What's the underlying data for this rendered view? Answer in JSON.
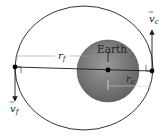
{
  "diagram": {
    "body_label": "Earth",
    "r_far": {
      "symbol": "r",
      "subscript": "f"
    },
    "r_close": {
      "symbol": "r",
      "subscript": "c"
    },
    "v_close": {
      "symbol": "v",
      "subscript": "c",
      "vector_arrow": "→"
    },
    "v_far": {
      "symbol": "v",
      "subscript": "f",
      "vector_arrow": "→"
    },
    "colors": {
      "earth_fill_center": "#8a8a8a",
      "earth_fill_edge": "#6a6a6a",
      "line": "#1a1a1a",
      "dimension_line": "#9a9a9a",
      "background": "#ffffff"
    }
  }
}
